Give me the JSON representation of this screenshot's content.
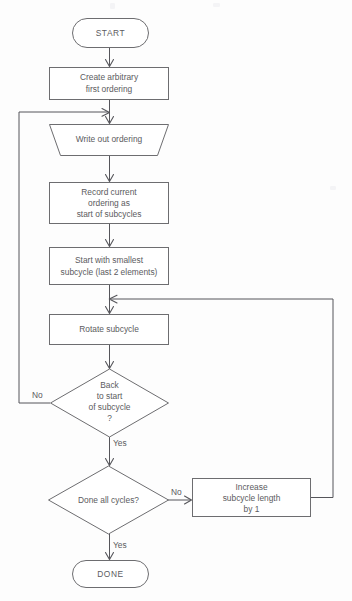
{
  "diagram": {
    "type": "flowchart",
    "orientation": "top-to-bottom",
    "background_color": "#fdfdfd",
    "line_color": "#55555a",
    "shape_stroke_color": "#6d6d70",
    "shape_fill_color": "#ffffff",
    "text_color": "#5b5b60"
  },
  "nodes": [
    {
      "id": "start",
      "shape": "terminator",
      "lines": [
        "START"
      ],
      "x": 110.5,
      "y": 33,
      "width": 76,
      "height": 30
    },
    {
      "id": "create-first-ordering",
      "shape": "process",
      "lines": [
        "Create arbitrary",
        "first ordering"
      ],
      "x": 108.5,
      "y": 83.5,
      "width": 119,
      "height": 33
    },
    {
      "id": "write-out-ordering",
      "shape": "manual-output-trapezoid",
      "lines": [
        "Write out ordering"
      ],
      "x": 108.5,
      "y": 140,
      "width": 119,
      "height": 32
    },
    {
      "id": "record-current-ordering",
      "shape": "process",
      "lines": [
        "Record current",
        "ordering as",
        "start of subcycles"
      ],
      "x": 108.5,
      "y": 203,
      "width": 119,
      "height": 42
    },
    {
      "id": "start-smallest-subcycle",
      "shape": "process",
      "lines": [
        "Start with smallest",
        "subcycle (last 2 elements)"
      ],
      "x": 108.5,
      "y": 266,
      "width": 119,
      "height": 38
    },
    {
      "id": "rotate-subcycle",
      "shape": "process",
      "lines": [
        "Rotate subcycle"
      ],
      "x": 108.5,
      "y": 329.5,
      "width": 119,
      "height": 31
    },
    {
      "id": "back-to-start-of-subcycle",
      "shape": "decision",
      "lines": [
        "Back",
        "to start",
        "of subcycle",
        "?"
      ],
      "x": 109,
      "y": 403,
      "width": 118,
      "height": 68
    },
    {
      "id": "done-all-cycles",
      "shape": "decision",
      "lines": [
        "Done all cycles?"
      ],
      "x": 108,
      "y": 500,
      "width": 120,
      "height": 68
    },
    {
      "id": "increase-subcycle-length",
      "shape": "process",
      "lines": [
        "Increase",
        "subcycle length",
        "by 1"
      ],
      "x": 251,
      "y": 497.5,
      "width": 118,
      "height": 39
    },
    {
      "id": "done",
      "shape": "terminator",
      "lines": [
        "DONE"
      ],
      "x": 110.5,
      "y": 574,
      "width": 76,
      "height": 28
    }
  ],
  "edges": [
    {
      "id": "start-to-create",
      "from": "start",
      "to": "create-first-ordering",
      "label": ""
    },
    {
      "id": "create-to-write",
      "from": "create-first-ordering",
      "to": "write-out-ordering",
      "label": ""
    },
    {
      "id": "write-to-record",
      "from": "write-out-ordering",
      "to": "record-current-ordering",
      "label": ""
    },
    {
      "id": "record-to-start-smallest",
      "from": "record-current-ordering",
      "to": "start-smallest-subcycle",
      "label": ""
    },
    {
      "id": "start-smallest-to-rotate",
      "from": "start-smallest-subcycle",
      "to": "rotate-subcycle",
      "label": ""
    },
    {
      "id": "rotate-to-back-decision",
      "from": "rotate-subcycle",
      "to": "back-to-start-of-subcycle",
      "label": ""
    },
    {
      "id": "back-decision-no-loop",
      "from": "back-to-start-of-subcycle",
      "to": "write-out-ordering",
      "label": "No"
    },
    {
      "id": "back-decision-yes",
      "from": "back-to-start-of-subcycle",
      "to": "done-all-cycles",
      "label": "Yes"
    },
    {
      "id": "done-all-cycles-no",
      "from": "done-all-cycles",
      "to": "increase-subcycle-length",
      "label": "No"
    },
    {
      "id": "increase-to-rotate-loop",
      "from": "increase-subcycle-length",
      "to": "rotate-subcycle",
      "label": ""
    },
    {
      "id": "done-all-cycles-yes",
      "from": "done-all-cycles",
      "to": "done",
      "label": "Yes"
    }
  ],
  "edge_labels": {
    "back_no": "No",
    "back_yes": "Yes",
    "cycles_no": "No",
    "cycles_yes": "Yes"
  }
}
